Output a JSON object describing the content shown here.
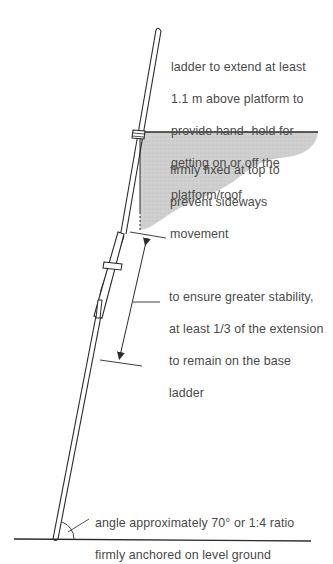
{
  "diagram": {
    "type": "ladder-safety-illustration",
    "annotations": {
      "top_extension": {
        "lines": [
          "ladder to extend at least",
          "1.1 m above platform to",
          "provide hand- hold for",
          "getting on or off the",
          "platform/roof"
        ]
      },
      "fixing": {
        "lines": [
          "firmly fixed at top to",
          "prevent sideways",
          "movement"
        ]
      },
      "overlap": {
        "lines": [
          "to ensure greater stability,",
          "at least 1/3 of the extension",
          "to remain on the base",
          "ladder"
        ]
      },
      "base": {
        "lines": [
          "angle approximately 70° or 1:4 ratio",
          "firmly anchored on level ground"
        ]
      }
    },
    "colors": {
      "line": "#2a2a2a",
      "platform_fill": "#c8c8c8",
      "text": "#4a4a4a",
      "background": "#ffffff"
    }
  }
}
